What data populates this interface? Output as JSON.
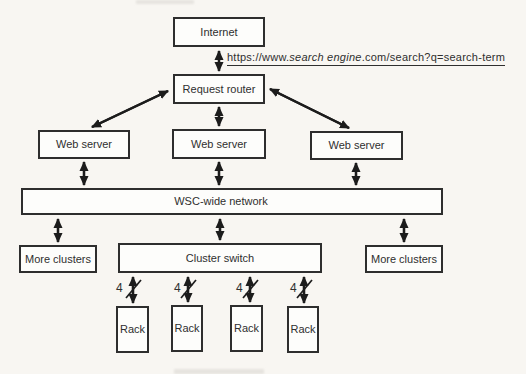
{
  "diagram": {
    "nodes": {
      "internet": "Internet",
      "request_router": "Request router",
      "web_server_1": "Web server",
      "web_server_2": "Web server",
      "web_server_3": "Web server",
      "wsc_network": "WSC-wide network",
      "more_clusters_left": "More clusters",
      "cluster_switch": "Cluster switch",
      "more_clusters_right": "More clusters",
      "rack_1": "Rack",
      "rack_2": "Rack",
      "rack_3": "Rack",
      "rack_4": "Rack"
    },
    "url": {
      "prefix": "https://www.",
      "italic": "search engine",
      "suffix": ".com/search?q=search-term"
    },
    "link_width_labels": [
      "4",
      "4",
      "4",
      "4"
    ],
    "colors": {
      "background": "#f8f6f2",
      "box_fill": "#fdfdfb",
      "box_border": "#2e2e2e",
      "text": "#2f2f2f",
      "arrow": "#1c1c1c"
    }
  }
}
